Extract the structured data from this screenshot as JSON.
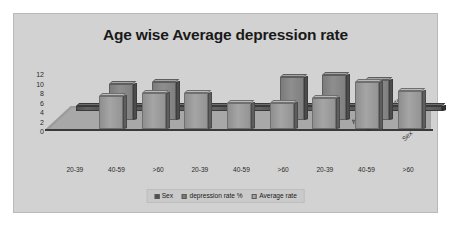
{
  "chart": {
    "title": "Age wise Average depression rate",
    "xlabel": "Age"
  },
  "chart_data": {
    "type": "bar",
    "title": "Age wise Average depression rate",
    "subtitle": "",
    "xlabel": "Age",
    "ylabel": "",
    "ylim": [
      0,
      12
    ],
    "yticks": [
      "12",
      "10",
      "8",
      "6",
      "4",
      "2",
      "0"
    ],
    "grid": false,
    "legend_position": "bottom",
    "three_d": true,
    "depth_axis_labels": [
      "Average rate",
      "depression rate %",
      "Sex"
    ],
    "categories": [
      "20-39",
      "40-59",
      ">60",
      "20-39",
      "40-59",
      ">60",
      "20-39",
      "40-59",
      ">60"
    ],
    "series": [
      {
        "name": "Sex",
        "color": "#4f4f4f",
        "values": [
          1,
          1,
          1,
          1,
          1,
          1,
          1,
          1,
          1
        ]
      },
      {
        "name": "depression rate %",
        "color": "#7b7b7b",
        "values": [
          0,
          7.5,
          8,
          0,
          0,
          9,
          9.5,
          8.5,
          0
        ]
      },
      {
        "name": "Average rate",
        "color": "#a5a5a5",
        "values": [
          0,
          7,
          7.5,
          7.5,
          5.5,
          5.5,
          6.5,
          10,
          8
        ]
      }
    ],
    "legend": [
      "Sex",
      "depression rate %",
      "Average rate"
    ]
  },
  "legend": {
    "items": [
      {
        "label": "Sex",
        "color": "#4f4f4f"
      },
      {
        "label": "depression rate %",
        "color": "#7b7b7b"
      },
      {
        "label": "Average rate",
        "color": "#a5a5a5"
      }
    ]
  },
  "axes": {
    "y_ticks": [
      "12",
      "10",
      "8",
      "6",
      "4",
      "2",
      "0"
    ],
    "x_ticks": [
      "20-39",
      "40-59",
      ">60",
      "20-39",
      "40-59",
      ">60",
      "20-39",
      "40-59",
      ">60"
    ],
    "depth_labels": [
      "Average rate",
      "depression rate %",
      "Sex"
    ]
  }
}
